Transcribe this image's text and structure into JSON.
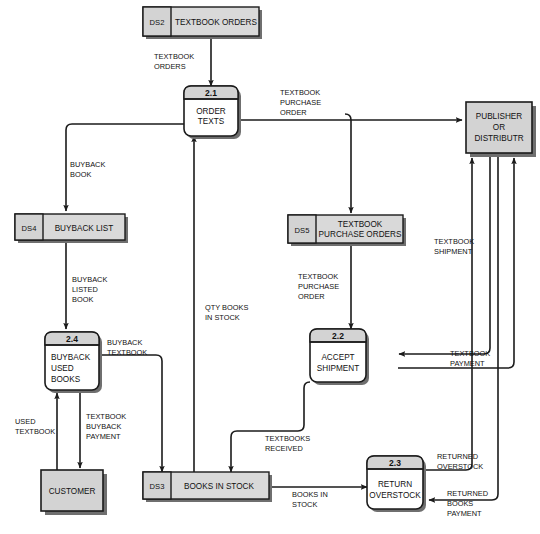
{
  "diagram": {
    "type": "data-flow-diagram",
    "processes": [
      {
        "id": "2.1",
        "label_lines": [
          "ORDER",
          "TEXTS"
        ]
      },
      {
        "id": "2.2",
        "label_lines": [
          "ACCEPT",
          "SHIPMENT"
        ]
      },
      {
        "id": "2.3",
        "label_lines": [
          "RETURN",
          "OVERSTOCK"
        ]
      },
      {
        "id": "2.4",
        "label_lines": [
          "BUYBACK",
          "USED",
          "BOOKS"
        ]
      }
    ],
    "data_stores": [
      {
        "id": "DS2",
        "name_lines": [
          "TEXTBOOK ORDERS"
        ]
      },
      {
        "id": "DS4",
        "name_lines": [
          "BUYBACK LIST"
        ]
      },
      {
        "id": "DS5",
        "name_lines": [
          "TEXTBOOK",
          "PURCHASE ORDERS"
        ]
      },
      {
        "id": "DS3",
        "name_lines": [
          "BOOKS IN STOCK"
        ]
      }
    ],
    "entities": [
      {
        "id": "publisher",
        "label_lines": [
          "PUBLISHER",
          "OR",
          "DISTRIBUTR"
        ]
      },
      {
        "id": "customer",
        "label_lines": [
          "CUSTOMER"
        ]
      }
    ],
    "flows": [
      {
        "id": "f1",
        "label_lines": [
          "TEXTBOOK",
          "ORDERS"
        ]
      },
      {
        "id": "f2",
        "label_lines": [
          "TEXTBOOK",
          "PURCHASE",
          "ORDER"
        ]
      },
      {
        "id": "f3",
        "label_lines": [
          "BUYBACK",
          "BOOK"
        ]
      },
      {
        "id": "f4",
        "label_lines": [
          "BUYBACK",
          "LISTED",
          "BOOK"
        ]
      },
      {
        "id": "f5",
        "label_lines": [
          "QTY BOOKS",
          "IN STOCK"
        ]
      },
      {
        "id": "f6",
        "label_lines": [
          "TEXTBOOK",
          "PURCHASE",
          "ORDER"
        ]
      },
      {
        "id": "f7",
        "label_lines": [
          "TEXTBOOK",
          "SHIPMENT"
        ]
      },
      {
        "id": "f8",
        "label_lines": [
          "TEXTBOOK",
          "PAYMENT"
        ]
      },
      {
        "id": "f9",
        "label_lines": [
          "BUYBACK",
          "TEXTBOOK"
        ]
      },
      {
        "id": "f10",
        "label_lines": [
          "USED",
          "TEXTBOOK"
        ]
      },
      {
        "id": "f11",
        "label_lines": [
          "TEXTBOOK",
          "BUYBACK",
          "PAYMENT"
        ]
      },
      {
        "id": "f12",
        "label_lines": [
          "TEXTBOOKS",
          "RECEIVED"
        ]
      },
      {
        "id": "f13",
        "label_lines": [
          "BOOKS IN",
          "STOCK"
        ]
      },
      {
        "id": "f14",
        "label_lines": [
          "RETURNED",
          "OVERSTOCK"
        ]
      },
      {
        "id": "f15",
        "label_lines": [
          "RETURNED",
          "BOOKS",
          "PAYMENT"
        ]
      }
    ]
  },
  "colors": {
    "stroke": "#1b1b1b",
    "store_fill": "#d9d9d9",
    "process_header_fill": "#d3d3d3",
    "entity_fill": "#d3d3d3",
    "shadow": "#6f6f6f",
    "background": "#ffffff"
  }
}
